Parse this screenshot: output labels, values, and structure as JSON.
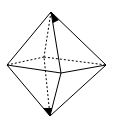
{
  "diagram": {
    "type": "octahedron",
    "stroke_color": "#000000",
    "background": "#ffffff",
    "vertices": {
      "top": [
        51,
        12
      ],
      "bottom": [
        50,
        116
      ],
      "left": [
        7,
        65
      ],
      "right": [
        106,
        65
      ],
      "front": [
        61,
        73
      ],
      "back": [
        44,
        57
      ]
    },
    "solid_edges": [
      "top-left",
      "top-right",
      "top-front",
      "bottom-left",
      "bottom-right",
      "bottom-front",
      "left-front",
      "front-right"
    ],
    "dashed_edges": [
      "top-back",
      "bottom-back",
      "left-back",
      "back-right"
    ],
    "marked_angles": [
      "top",
      "bottom"
    ]
  }
}
